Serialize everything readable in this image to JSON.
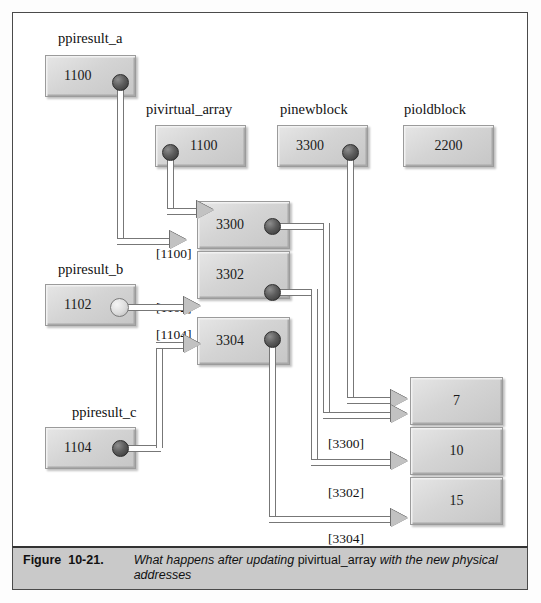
{
  "figure": {
    "number": "Figure",
    "id": "10-21.",
    "caption_pre": "What happens after updating ",
    "caption_mono": "pivirtual_array",
    "caption_post": " with the new physical addresses"
  },
  "pointers": {
    "ppiresult_a": {
      "label": "ppiresult_a",
      "value": "1100"
    },
    "pivirtual_array": {
      "label": "pivirtual_array",
      "value": "1100"
    },
    "pinewblock": {
      "label": "pinewblock",
      "value": "3300"
    },
    "pioldblock": {
      "label": "pioldblock",
      "value": "2200"
    },
    "ppiresult_b": {
      "label": "ppiresult_b",
      "value": "1102"
    },
    "ppiresult_c": {
      "label": "ppiresult_c",
      "value": "1104"
    }
  },
  "virtual_array": {
    "cells": [
      {
        "address": "[1100]",
        "value": "3300"
      },
      {
        "address": "[1102]",
        "value": "3302"
      },
      {
        "address": "[1104]",
        "value": "3304"
      }
    ]
  },
  "physical_block": {
    "cells": [
      {
        "address": "[3300]",
        "value": "7"
      },
      {
        "address": "[3302]",
        "value": "10"
      },
      {
        "address": "[3304]",
        "value": "15"
      }
    ]
  }
}
